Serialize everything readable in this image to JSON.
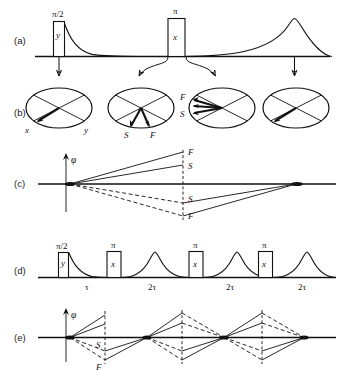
{
  "figure": {
    "background": "#ffffff",
    "ink": "#111111",
    "width": 347,
    "height": 372
  },
  "rows": [
    {
      "id": "a",
      "label": "(a)",
      "caption": "single spin-echo pulse sequence with free induction decay and echo"
    },
    {
      "id": "b",
      "label": "(b)",
      "caption": "rotating-frame magnetization vector diagrams"
    },
    {
      "id": "c",
      "label": "(c)",
      "caption": "phase evolution of fast and slow spin isochromats"
    },
    {
      "id": "d",
      "label": "(d)",
      "caption": "Carr-Purcell-Meiboom-Gill multi-echo train"
    },
    {
      "id": "e",
      "label": "(e)",
      "caption": "phase evolution for repeated refocusing"
    }
  ],
  "row_a": {
    "pulses": [
      {
        "name": "pi-over-2-pulse",
        "top_label": "π/2",
        "inner_label": "y"
      },
      {
        "name": "pi-pulse",
        "top_label": "π",
        "inner_label": "x"
      }
    ],
    "signals": [
      {
        "name": "free-induction-decay"
      },
      {
        "name": "spin-echo"
      }
    ],
    "connectors": 4
  },
  "row_b": {
    "circles": [
      {
        "name": "vector-diagram-after-90",
        "axis_labels": [
          "x",
          "y"
        ],
        "vectors": [
          {
            "label": "",
            "name": "magnetization-vector"
          }
        ]
      },
      {
        "name": "vector-diagram-dephasing",
        "axis_labels": [],
        "vectors": [
          {
            "label": "S",
            "name": "slow-isochromat-vector"
          },
          {
            "label": "F",
            "name": "fast-isochromat-vector"
          }
        ]
      },
      {
        "name": "vector-diagram-after-180",
        "axis_labels": [],
        "vectors": [
          {
            "label": "F",
            "name": "fast-isochromat-vector"
          },
          {
            "label": "S",
            "name": "slow-isochromat-vector"
          }
        ]
      },
      {
        "name": "vector-diagram-refocused",
        "axis_labels": [],
        "vectors": [
          {
            "label": "",
            "name": "refocused-vector"
          }
        ]
      }
    ]
  },
  "row_c": {
    "axis_label": "φ",
    "markers": [
      {
        "label": "F",
        "name": "fast-upper-marker"
      },
      {
        "label": "S",
        "name": "slow-upper-marker"
      },
      {
        "label": "S",
        "name": "slow-lower-marker"
      },
      {
        "label": "F",
        "name": "fast-lower-marker"
      }
    ]
  },
  "row_d": {
    "pulses": [
      {
        "top_label": "π/2",
        "inner_label": "y",
        "name": "pi-over-2-pulse"
      },
      {
        "top_label": "π",
        "inner_label": "x",
        "name": "pi-pulse-1"
      },
      {
        "top_label": "π",
        "inner_label": "x",
        "name": "pi-pulse-2"
      },
      {
        "top_label": "π",
        "inner_label": "x",
        "name": "pi-pulse-3"
      }
    ],
    "intervals": [
      {
        "label": "τ",
        "name": "interval-tau"
      },
      {
        "label": "2τ",
        "name": "interval-2tau-1"
      },
      {
        "label": "2τ",
        "name": "interval-2tau-2"
      },
      {
        "label": "2τ",
        "name": "interval-2tau-3"
      }
    ]
  },
  "row_e": {
    "axis_label": "φ",
    "markers": [
      {
        "label": "S",
        "name": "slow-marker"
      },
      {
        "label": "F",
        "name": "fast-marker"
      }
    ]
  }
}
